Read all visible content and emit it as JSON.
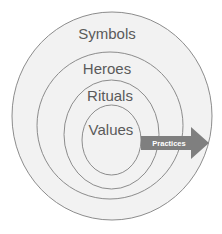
{
  "diagram": {
    "type": "onion-model",
    "layers": [
      {
        "label": "Symbols",
        "level": "outermost"
      },
      {
        "label": "Heroes",
        "level": "second"
      },
      {
        "label": "Rituals",
        "level": "third"
      },
      {
        "label": "Values",
        "level": "core"
      }
    ],
    "arrow": {
      "label": "Practices",
      "direction": "right",
      "spans": [
        "Symbols",
        "Heroes",
        "Rituals"
      ]
    }
  },
  "colors": {
    "fill": "#f2f2f2",
    "stroke": "#8c8c8c",
    "text": "#5a5a5a",
    "arrow": "#7f7f7f",
    "arrow_text": "#ffffff"
  }
}
